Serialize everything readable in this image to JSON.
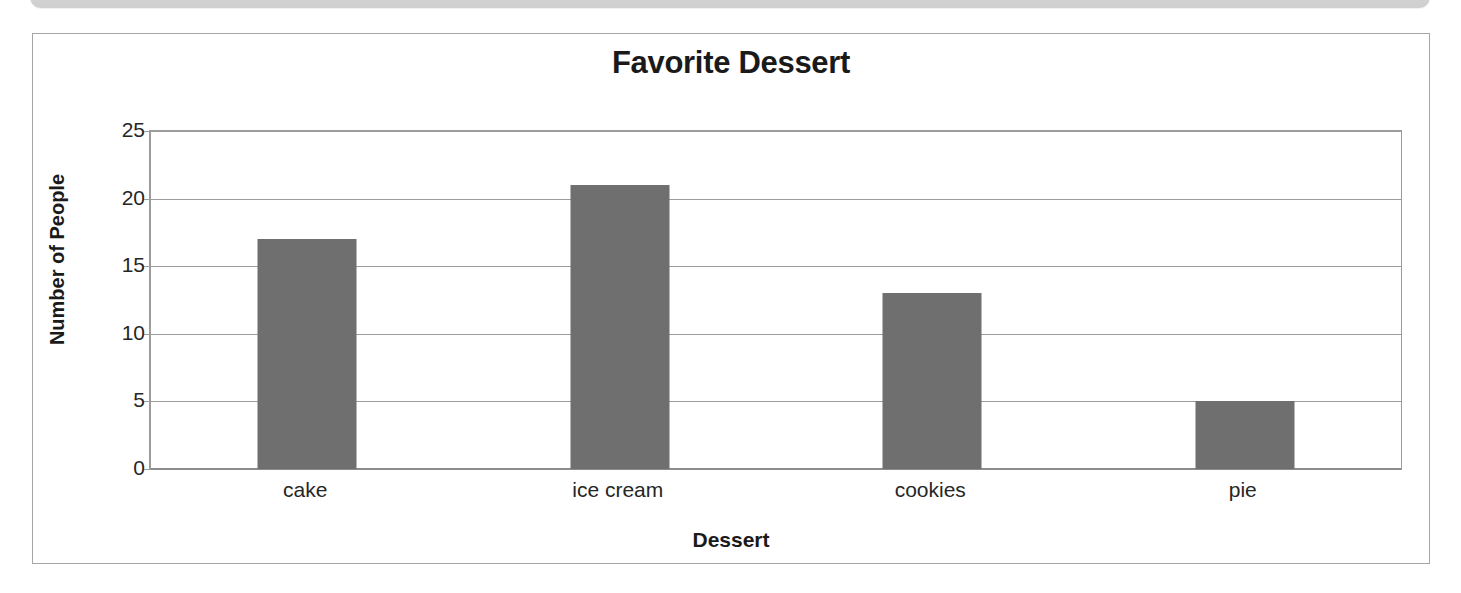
{
  "page": {
    "background_color": "#ffffff",
    "clipped_header_box": {
      "name": "clipped-rounded-text-box",
      "color": "#d4d4d4",
      "left_glyph": "y",
      "mid_glyph": "p"
    }
  },
  "chart_frame": {
    "border_color": "#a6a6a6",
    "background_color": "#ffffff"
  },
  "chart_data": {
    "type": "bar",
    "title": "Favorite Dessert",
    "xlabel": "Dessert",
    "ylabel": "Number of People",
    "categories": [
      "cake",
      "ice cream",
      "cookies",
      "pie"
    ],
    "values": [
      17,
      21,
      13,
      5
    ],
    "ylim": [
      0,
      25
    ],
    "yticks": [
      0,
      5,
      10,
      15,
      20,
      25
    ],
    "ytick_labels": [
      "0",
      "5",
      "10",
      "15",
      "20",
      "25"
    ],
    "grid": true,
    "grid_axis": "y",
    "grid_color": "#9c9c9c",
    "legend": false,
    "bar_color": "#6f6f6f",
    "bar_edge_color": "#6f6f6f",
    "axis_color": "#9c9c9c",
    "text_color": "#262626",
    "title_color": "#1a1a1a"
  }
}
